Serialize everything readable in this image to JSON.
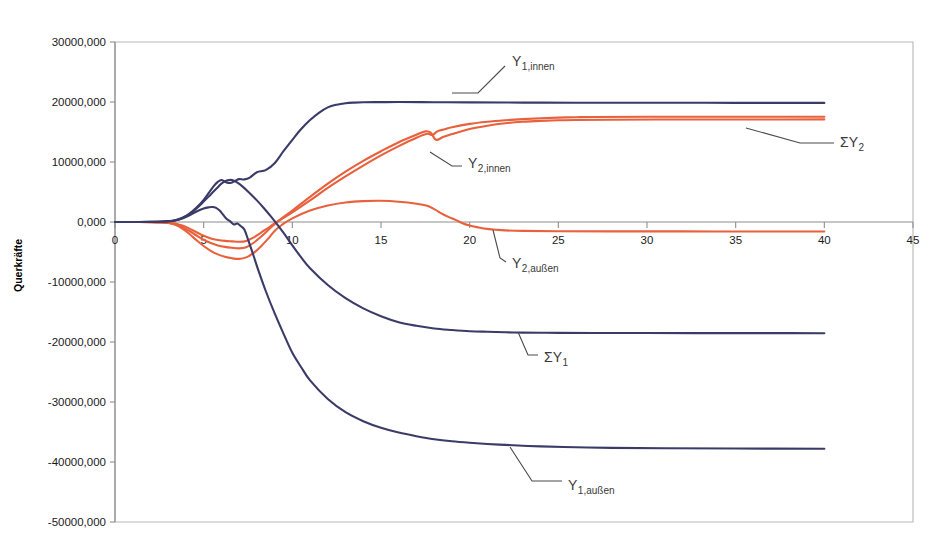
{
  "chart_data": {
    "type": "line",
    "title": "",
    "xlabel": "",
    "ylabel": "Querkräfte",
    "xlim": [
      0,
      45
    ],
    "ylim": [
      -50000,
      30000
    ],
    "grid": false,
    "legend_position": "inline-annotations",
    "x_ticks": [
      "0",
      "5",
      "10",
      "15",
      "20",
      "25",
      "30",
      "35",
      "40",
      "45"
    ],
    "x_tick_values": [
      0,
      5,
      10,
      15,
      20,
      25,
      30,
      35,
      40,
      45
    ],
    "y_ticks": [
      "30000,000",
      "20000,000",
      "10000,000",
      "0,000",
      "-10000,000",
      "-20000,000",
      "-30000,000",
      "-40000,000",
      "-50000,000"
    ],
    "y_tick_values": [
      30000,
      20000,
      10000,
      0,
      -10000,
      -20000,
      -30000,
      -40000,
      -50000
    ],
    "colors": {
      "navy": "#3b3b68",
      "orange": "#e8603c",
      "frame": "#b7b7b7",
      "axis": "#8e8e8e",
      "leader": "#4a4a4a"
    },
    "series": [
      {
        "name": "Y1,innen",
        "color": "#3b3b68",
        "x": [
          0,
          1,
          2,
          2.6,
          3,
          3.4,
          3.8,
          4.2,
          4.6,
          5,
          5.3,
          5.6,
          5.8,
          6.0,
          6.2,
          6.4,
          6.6,
          6.8,
          7.0,
          7.3,
          7.6,
          8.0,
          8.5,
          9.0,
          9.5,
          10,
          10.5,
          11,
          11.5,
          12,
          12.5,
          13,
          13.5,
          14,
          15,
          16,
          18,
          20,
          23,
          26,
          30,
          35,
          40
        ],
        "values": [
          0,
          0,
          20,
          60,
          140,
          300,
          700,
          1400,
          2400,
          3700,
          4900,
          6100,
          6700,
          7000,
          6700,
          6500,
          6600,
          6900,
          7150,
          7100,
          7400,
          8300,
          8650,
          9800,
          11800,
          13700,
          15500,
          17000,
          18200,
          19100,
          19550,
          19800,
          19900,
          19950,
          19980,
          19990,
          19960,
          19930,
          19900,
          19880,
          19870,
          19860,
          19850
        ]
      },
      {
        "name": "SigmaY2",
        "color": "#e8603c",
        "x": [
          0,
          1,
          2,
          2.6,
          3,
          3.4,
          3.8,
          4.2,
          4.6,
          5,
          5.4,
          5.8,
          6.2,
          6.6,
          7.0,
          7.4,
          7.8,
          8.2,
          8.6,
          9.0,
          9.4,
          10,
          11,
          12,
          13,
          14,
          15,
          16,
          17,
          17.6,
          17.9,
          18.2,
          18.6,
          19,
          20,
          21,
          22,
          23,
          24,
          25,
          26,
          27,
          30,
          34,
          38,
          40
        ],
        "values": [
          0,
          0,
          -10,
          -40,
          -100,
          -260,
          -600,
          -1100,
          -1700,
          -2300,
          -2750,
          -3000,
          -3150,
          -3230,
          -3300,
          -3150,
          -2600,
          -1850,
          -1050,
          -250,
          500,
          1600,
          3600,
          5700,
          7600,
          9400,
          11100,
          12650,
          14050,
          14700,
          14500,
          15150,
          15450,
          15800,
          16350,
          16700,
          16950,
          17150,
          17300,
          17400,
          17460,
          17500,
          17530,
          17540,
          17545,
          17550
        ]
      },
      {
        "name": "Y2,innen",
        "color": "#e8603c",
        "x": [
          0,
          1,
          2,
          2.6,
          3,
          3.4,
          3.8,
          4.2,
          4.6,
          5,
          5.4,
          5.8,
          6.2,
          6.6,
          7.0,
          7.4,
          7.8,
          8.2,
          8.6,
          9.0,
          9.4,
          10,
          11,
          12,
          13,
          14,
          15,
          16,
          17,
          17.5,
          17.8,
          18.1,
          18.5,
          19,
          20,
          21,
          22,
          23,
          24,
          25,
          26,
          28,
          32,
          36,
          40
        ],
        "values": [
          0,
          0,
          -15,
          -55,
          -140,
          -360,
          -850,
          -1500,
          -2250,
          -2950,
          -3500,
          -3900,
          -4150,
          -4300,
          -4400,
          -4200,
          -3500,
          -2550,
          -1450,
          -350,
          600,
          1900,
          4200,
          6400,
          8400,
          10200,
          11800,
          13300,
          14550,
          15100,
          14900,
          13700,
          14150,
          14650,
          15500,
          16050,
          16450,
          16700,
          16850,
          16950,
          17000,
          17050,
          17080,
          17090,
          17100
        ]
      },
      {
        "name": "Y2,aussen",
        "color": "#e8603c",
        "x": [
          0,
          1,
          2,
          2.6,
          3,
          3.4,
          3.8,
          4.2,
          4.6,
          5,
          5.4,
          5.8,
          6.2,
          6.6,
          7.0,
          7.4,
          7.8,
          8.2,
          8.6,
          9.0,
          9.4,
          10,
          11,
          12,
          13,
          14,
          15,
          16,
          17,
          17.6,
          18,
          18.4,
          18.8,
          19.2,
          19.6,
          20,
          20.5,
          21,
          21.5,
          22,
          23,
          25,
          28,
          32,
          36,
          40
        ],
        "values": [
          0,
          0,
          -20,
          -70,
          -180,
          -480,
          -1100,
          -2000,
          -3050,
          -4000,
          -4800,
          -5400,
          -5800,
          -6050,
          -6150,
          -5900,
          -5200,
          -4150,
          -2900,
          -1500,
          -500,
          600,
          1900,
          2750,
          3250,
          3480,
          3530,
          3380,
          3050,
          2700,
          2150,
          1450,
          850,
          350,
          -200,
          -600,
          -900,
          -1150,
          -1300,
          -1400,
          -1480,
          -1530,
          -1560,
          -1570,
          -1575,
          -1580
        ]
      },
      {
        "name": "SigmaY1",
        "color": "#3b3b68",
        "x": [
          0,
          1,
          2,
          2.6,
          3,
          3.4,
          3.8,
          4.2,
          4.6,
          5,
          5.4,
          5.8,
          6.0,
          6.3,
          6.6,
          6.9,
          7.2,
          7.6,
          8.0,
          8.4,
          8.8,
          9.2,
          9.6,
          10,
          10.5,
          11,
          12,
          13,
          14,
          15,
          16,
          17,
          18,
          19,
          20,
          21,
          22,
          23,
          24,
          25,
          27,
          30,
          34,
          38,
          40
        ],
        "values": [
          0,
          0,
          15,
          50,
          120,
          280,
          650,
          1300,
          2250,
          3400,
          4600,
          5800,
          6400,
          6900,
          7000,
          6550,
          5900,
          4800,
          3600,
          2300,
          900,
          -600,
          -2200,
          -3900,
          -5900,
          -7700,
          -10500,
          -12700,
          -14400,
          -15700,
          -16700,
          -17300,
          -17750,
          -18000,
          -18200,
          -18300,
          -18380,
          -18430,
          -18460,
          -18480,
          -18500,
          -18510,
          -18520,
          -18525,
          -18530
        ]
      },
      {
        "name": "Y1,aussen",
        "color": "#3b3b68",
        "x": [
          0,
          1,
          2,
          2.6,
          3,
          3.4,
          3.8,
          4.2,
          4.6,
          5,
          5.3,
          5.5,
          5.7,
          5.9,
          6.1,
          6.3,
          6.5,
          6.7,
          6.9,
          7.1,
          7.3,
          7.5,
          7.8,
          8.1,
          8.5,
          9,
          9.5,
          10,
          10.5,
          11,
          12,
          13,
          14,
          15,
          16,
          17,
          18,
          19,
          20,
          21,
          22,
          23,
          24,
          26,
          28,
          31,
          35,
          40
        ],
        "values": [
          0,
          0,
          10,
          40,
          110,
          250,
          600,
          1100,
          1750,
          2250,
          2450,
          2500,
          2350,
          1900,
          1200,
          500,
          100,
          -400,
          -250,
          -700,
          -1300,
          -2900,
          -5500,
          -8200,
          -11500,
          -15200,
          -18600,
          -21800,
          -24200,
          -26400,
          -29500,
          -31700,
          -33200,
          -34300,
          -35100,
          -35700,
          -36200,
          -36550,
          -36800,
          -37000,
          -37150,
          -37300,
          -37400,
          -37550,
          -37650,
          -37720,
          -37760,
          -37800
        ]
      }
    ],
    "annotations": [
      {
        "id": "y1-innen",
        "text": "Y",
        "sub": "1,innen",
        "x": 512,
        "y": 66,
        "leader": "M 452,93 L 478,93 L 505,66"
      },
      {
        "id": "sigma-y2",
        "text": "ΣY",
        "sub": "2",
        "x": 840,
        "y": 147,
        "leader": "M 746,128 L 800,143 L 834,143"
      },
      {
        "id": "y2-innen",
        "text": "Y",
        "sub": "2,innen",
        "x": 468,
        "y": 168,
        "leader": "M 430,152 L 452,166 L 462,166"
      },
      {
        "id": "y2-aussen",
        "text": "Y",
        "sub": "2,außen",
        "x": 512,
        "y": 268,
        "leader": "M 493,230 L 500,258 L 506,262"
      },
      {
        "id": "sigma-y1",
        "text": "ΣY",
        "sub": "1",
        "x": 544,
        "y": 362,
        "leader": "M 518,332 L 528,355 L 538,355"
      },
      {
        "id": "y1-aussen",
        "text": "Y",
        "sub": "1,außen",
        "x": 568,
        "y": 490,
        "leader": "M 510,447 L 532,481 L 562,481"
      }
    ]
  }
}
